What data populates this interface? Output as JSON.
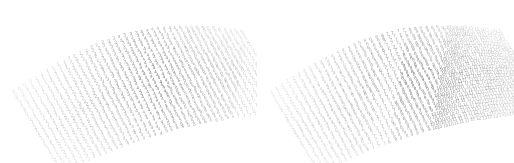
{
  "figure": {
    "title": "",
    "background": "#ffffff",
    "width": 514,
    "height": 163,
    "panel_count": 2
  },
  "chart_data": [
    {
      "type": "scatter",
      "name": "left-panel",
      "title": "",
      "xlabel": "",
      "ylabel": "",
      "description": "Projected quadrilateral mesh of integer-labelled nodes; label value increases toward the lower-right.",
      "grid": false,
      "legend": "none",
      "label_kind": "integer",
      "value_min": 0,
      "value_max": 8,
      "value_labels": [
        "0",
        "1",
        "2",
        "3",
        "4",
        "5",
        "6",
        "7",
        "8"
      ],
      "corner_values": {
        "top_left": 0,
        "top_right": 6,
        "bottom_left": 2,
        "bottom_right": 7
      },
      "edge_left_values": [
        0,
        0,
        0,
        1,
        1,
        2,
        2
      ],
      "edge_right_values": [
        5,
        5,
        6,
        6,
        7,
        7,
        7
      ],
      "edge_top_values": [
        0,
        1,
        1,
        2,
        2,
        3,
        3,
        4,
        4,
        5,
        5,
        6
      ],
      "edge_bottom_values": [
        2,
        2,
        3,
        3,
        4,
        4,
        5,
        5,
        6,
        6,
        7,
        7
      ],
      "rows": 30,
      "cols": 42,
      "text_color": "#707070",
      "text_color_dark": "#4a4a4a",
      "font_size_px": 4.6,
      "projection": {
        "origin_x": 14,
        "origin_y": 92,
        "u_dx": 5.55,
        "u_dy": -1.48,
        "v_dx": 1.62,
        "v_dy": 2.72,
        "dome_amplitude": -22,
        "skew": 0.18
      }
    },
    {
      "type": "scatter",
      "name": "right-panel",
      "title": "",
      "xlabel": "",
      "ylabel": "",
      "description": "Projected quadrilateral mesh of integer-labelled nodes spanning a wider value range, including two-digit labels.",
      "grid": false,
      "legend": "none",
      "label_kind": "integer",
      "value_min": 1,
      "value_max": 15,
      "value_labels": [
        "1",
        "2",
        "3",
        "4",
        "5",
        "6",
        "7",
        "8",
        "9",
        "10",
        "11",
        "12",
        "13",
        "14",
        "15"
      ],
      "corner_values": {
        "top_left": 1,
        "top_right": 12,
        "bottom_left": 4,
        "bottom_right": 15
      },
      "edge_left_values": [
        1,
        1,
        1,
        2,
        3,
        4,
        4
      ],
      "edge_right_values": [
        11,
        11,
        11,
        12,
        12,
        13,
        14,
        15
      ],
      "edge_top_values": [
        1,
        2,
        3,
        4,
        5,
        6,
        7,
        8,
        9,
        10,
        11,
        12
      ],
      "edge_bottom_values": [
        4,
        5,
        6,
        7,
        8,
        9,
        10,
        11,
        12,
        13,
        14,
        15
      ],
      "rows": 30,
      "cols": 42,
      "text_color": "#707070",
      "text_color_dark": "#444444",
      "font_size_px": 4.6,
      "projection": {
        "origin_x": 14,
        "origin_y": 92,
        "u_dx": 5.55,
        "u_dy": -1.48,
        "v_dx": 1.62,
        "v_dy": 2.72,
        "dome_amplitude": -22,
        "skew": 0.18
      }
    }
  ]
}
